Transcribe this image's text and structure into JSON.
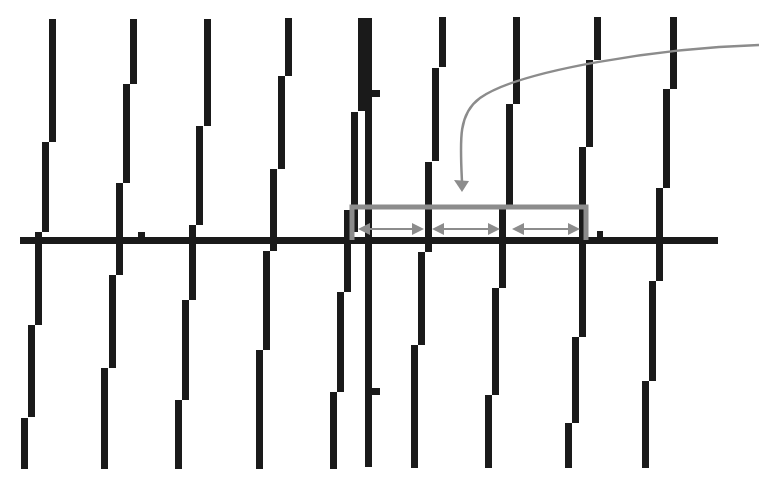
{
  "diagram": {
    "colors": {
      "background": "#ffffff",
      "bars": "#1a1a1a",
      "annotation": "#8c8c8c"
    },
    "axis": {
      "x1": 20,
      "x2": 718,
      "y": 237,
      "thickness": 7
    },
    "bar_width": 7,
    "segments": [
      [
        49,
        19,
        142
      ],
      [
        42,
        142,
        232
      ],
      [
        35,
        232,
        240
      ],
      [
        35,
        244,
        325
      ],
      [
        28,
        325,
        417
      ],
      [
        21,
        418,
        469
      ],
      [
        130,
        19,
        84
      ],
      [
        123,
        84,
        183
      ],
      [
        116,
        183,
        275
      ],
      [
        109,
        275,
        368
      ],
      [
        101,
        368,
        469
      ],
      [
        204,
        19,
        126
      ],
      [
        196,
        126,
        225
      ],
      [
        189,
        225,
        300
      ],
      [
        182,
        300,
        400
      ],
      [
        175,
        400,
        469
      ],
      [
        285,
        18,
        76
      ],
      [
        278,
        76,
        169
      ],
      [
        270,
        169,
        251
      ],
      [
        263,
        251,
        350
      ],
      [
        256,
        350,
        469
      ],
      [
        351,
        112,
        232
      ],
      [
        344,
        210,
        292
      ],
      [
        337,
        292,
        392
      ],
      [
        330,
        392,
        469
      ],
      [
        365,
        18,
        467
      ],
      [
        439,
        17,
        67
      ],
      [
        432,
        68,
        161
      ],
      [
        425,
        162,
        252
      ],
      [
        418,
        252,
        345
      ],
      [
        411,
        345,
        468
      ],
      [
        513,
        17,
        104
      ],
      [
        506,
        104,
        207
      ],
      [
        499,
        207,
        288
      ],
      [
        492,
        288,
        395
      ],
      [
        485,
        395,
        468
      ],
      [
        594,
        17,
        60
      ],
      [
        586,
        60,
        147
      ],
      [
        579,
        147,
        337
      ],
      [
        572,
        337,
        423
      ],
      [
        565,
        423,
        468
      ],
      [
        670,
        17,
        89
      ],
      [
        663,
        89,
        188
      ],
      [
        656,
        188,
        281
      ],
      [
        649,
        281,
        381
      ],
      [
        642,
        381,
        468
      ]
    ],
    "thick_block": {
      "x": 358,
      "y": 18,
      "w": 14,
      "h": 93
    },
    "tabs": [
      {
        "x": 372,
        "y": 90,
        "w": 8,
        "h": 7
      },
      {
        "x": 372,
        "y": 388,
        "w": 8,
        "h": 7
      },
      {
        "x": 138,
        "y": 232,
        "w": 7,
        "h": 6
      },
      {
        "x": 597,
        "y": 231,
        "w": 6,
        "h": 7
      }
    ],
    "bracket": {
      "x1": 352,
      "x2": 586,
      "top": 207,
      "bottom": 240
    },
    "interval_arrows": [
      {
        "x1": 358,
        "x2": 424,
        "y": 229
      },
      {
        "x1": 432,
        "x2": 500,
        "y": 229
      },
      {
        "x1": 512,
        "x2": 580,
        "y": 229
      }
    ],
    "pointer_curve": {
      "path": "M 759 45 C 660 48, 520 70, 480 98 C 458 114, 460 140, 462 182",
      "arrow_tip": [
        462,
        192
      ]
    }
  }
}
